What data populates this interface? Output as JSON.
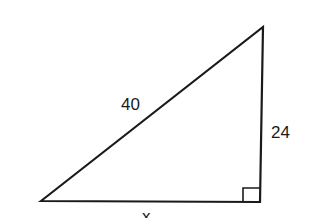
{
  "diagram": {
    "type": "right-triangle",
    "vertices": {
      "top": [
        263,
        27
      ],
      "bottom_left": [
        41,
        201
      ],
      "bottom_right": [
        260,
        202
      ]
    },
    "right_angle_at": "bottom_right",
    "labels": {
      "hypotenuse": "40",
      "vertical_leg": "24",
      "horizontal_leg": "x"
    },
    "colors": {
      "stroke": "#1a1a1a",
      "background": "#ffffff"
    }
  }
}
